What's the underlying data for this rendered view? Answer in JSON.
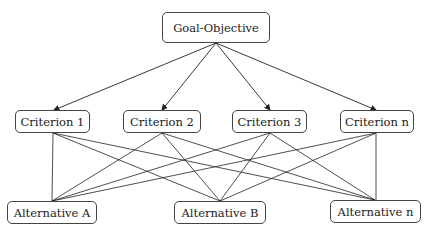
{
  "diagram": {
    "type": "hierarchy",
    "goal": {
      "label": "Goal-Objective"
    },
    "criteria": [
      {
        "label": "Criterion 1"
      },
      {
        "label": "Criterion 2"
      },
      {
        "label": "Criterion 3"
      },
      {
        "label": "Criterion n"
      }
    ],
    "alternatives": [
      {
        "label": "Alternative A"
      },
      {
        "label": "Alternative B"
      },
      {
        "label": "Alternative n"
      }
    ],
    "edges": {
      "goal_to_criteria": "arrows",
      "criteria_to_alternatives": "all-to-all lines"
    },
    "colors": {
      "line": "#222222",
      "border": "#444444",
      "background": "#ffffff"
    }
  }
}
